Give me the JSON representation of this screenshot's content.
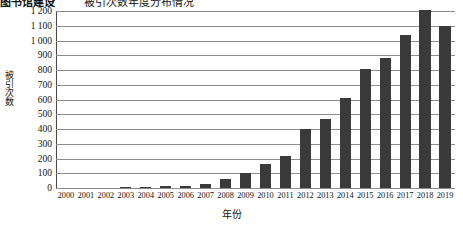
{
  "figure": {
    "title_partial": "被引次数年度分布情况",
    "left_label_partial": "图书馆建设",
    "bar_color": "#3a3a3a",
    "gridline_color": "#8c8c8c",
    "axis_color": "#4a4a4a"
  },
  "chart_data": {
    "type": "bar",
    "title": "被引次数年度分布情况",
    "xlabel": "年份",
    "ylabel": "被引次数",
    "ylim": [
      0,
      1200
    ],
    "ytick_step": 100,
    "grid": true,
    "legend": "none",
    "categories": [
      "2000",
      "2001",
      "2002",
      "2003",
      "2004",
      "2005",
      "2006",
      "2007",
      "2008",
      "2009",
      "2010",
      "2011",
      "2012",
      "2013",
      "2014",
      "2015",
      "2016",
      "2017",
      "2018",
      "2019"
    ],
    "values": [
      0,
      0,
      0,
      2,
      6,
      14,
      16,
      30,
      62,
      105,
      165,
      220,
      400,
      470,
      610,
      805,
      880,
      1040,
      1205,
      1100
    ],
    "ytick_labels": [
      "1 200",
      "1 100",
      "1 000",
      "900",
      "800",
      "700",
      "600",
      "500",
      "400",
      "300",
      "200",
      "100",
      "0"
    ],
    "ytick_values": [
      1200,
      1100,
      1000,
      900,
      800,
      700,
      600,
      500,
      400,
      300,
      200,
      100,
      0
    ]
  }
}
